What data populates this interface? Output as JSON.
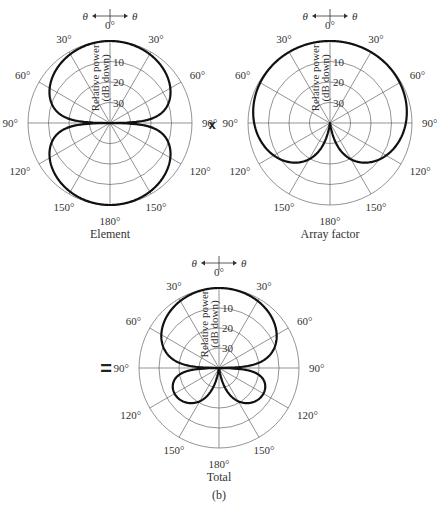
{
  "figure_label": "(b)",
  "operators": {
    "times": "x",
    "equals": "="
  },
  "common": {
    "radial_axis_label_line1": "Relative power",
    "radial_axis_label_line2": "(dB down)",
    "radial_ticks": [
      "10",
      "20",
      "30"
    ],
    "theta_symbol": "θ",
    "angle_labels": {
      "top": "0°",
      "upper_left": "30°",
      "upper_right": "30°",
      "mid_upper_left": "60°",
      "mid_upper_right": "60°",
      "left": "90°",
      "right": "90°",
      "mid_lower_left": "120°",
      "mid_lower_right": "120°",
      "lower_left": "150°",
      "lower_right": "150°",
      "bottom": "180°"
    }
  },
  "plots": [
    {
      "id": "element",
      "caption": "Element",
      "cx": 110,
      "cy": 123,
      "r": 82
    },
    {
      "id": "array_factor",
      "caption": "Array factor",
      "cx": 330,
      "cy": 123,
      "r": 82
    },
    {
      "id": "total",
      "caption": "Total",
      "cx": 219,
      "cy": 368,
      "r": 80
    }
  ],
  "chart_data": [
    {
      "type": "polar",
      "title": "Element",
      "radial_label": "Relative power (dB down)",
      "radial_ticks_db": [
        0,
        10,
        20,
        30,
        40
      ],
      "angle_ticks_deg": [
        0,
        30,
        60,
        90,
        120,
        150,
        180
      ],
      "description": "Two symmetric lobes (doublet), maxima at 0° and 180°, nulls at ±90°",
      "theta_deg": [
        0,
        30,
        60,
        80,
        90,
        100,
        120,
        150,
        180
      ],
      "db_down": [
        0,
        1.2,
        6,
        15,
        40,
        15,
        6,
        1.2,
        0
      ]
    },
    {
      "type": "polar",
      "title": "Array factor",
      "radial_label": "Relative power (dB down)",
      "radial_ticks_db": [
        0,
        10,
        20,
        30,
        40
      ],
      "angle_ticks_deg": [
        0,
        30,
        60,
        90,
        120,
        150,
        180
      ],
      "description": "Cardioid, maximum at 0°, null at 180°",
      "theta_deg": [
        0,
        30,
        60,
        90,
        120,
        150,
        180
      ],
      "db_down": [
        0,
        0.3,
        1.2,
        3,
        6,
        12,
        40
      ]
    },
    {
      "type": "polar",
      "title": "Total",
      "radial_label": "Relative power (dB down)",
      "radial_ticks_db": [
        0,
        10,
        20,
        30,
        40
      ],
      "angle_ticks_deg": [
        0,
        30,
        60,
        90,
        120,
        150,
        180
      ],
      "description": "Product of element and array factor: large main lobe toward 0°, two small back lobes near ±140°, nulls at ±90° and 180°",
      "theta_deg": [
        0,
        30,
        60,
        80,
        90,
        100,
        120,
        140,
        160,
        180
      ],
      "db_down": [
        0,
        1.5,
        7,
        18,
        40,
        20,
        13,
        16,
        22,
        40
      ]
    }
  ]
}
